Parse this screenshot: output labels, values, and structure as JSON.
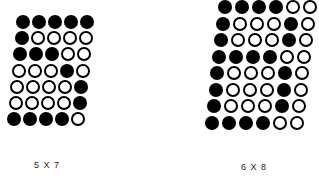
{
  "matrices": [
    {
      "label": "5 X 7",
      "cols": 5,
      "rows": 7,
      "origin": [
        16,
        15
      ],
      "pitch_x": 16,
      "pitch_y": 16.2,
      "slant": -1.5,
      "pattern": [
        "11111",
        "10000",
        "11100",
        "00010",
        "00001",
        "00001",
        "11110"
      ]
    },
    {
      "label": "6 X 8",
      "cols": 6,
      "rows": 8,
      "origin": [
        218,
        0
      ],
      "pitch_x": 17,
      "pitch_y": 16.5,
      "slant": -1.9,
      "pattern": [
        "111100",
        "100010",
        "100010",
        "111100",
        "100010",
        "100010",
        "100010",
        "111100"
      ]
    }
  ],
  "labels": {
    "left": "5 X 7",
    "right": "6 X 8"
  }
}
